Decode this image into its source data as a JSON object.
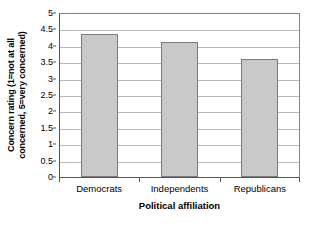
{
  "chart_data": {
    "type": "bar",
    "title": "",
    "categories": [
      "Democrats",
      "Independents",
      "Republicans"
    ],
    "values": [
      4.4,
      4.15,
      3.62
    ],
    "series": [
      {
        "name": "Concern rating",
        "values": [
          4.4,
          4.15,
          3.62
        ]
      }
    ],
    "xlabel": "Political affiliation",
    "ylabel": "Concern rating (1=not at all concerned, 5=very concerned)",
    "ylabel_line1": "Concern rating (1=not at all",
    "ylabel_line2": "concerned, 5=very concerned)",
    "ylim": [
      0,
      5
    ],
    "ytick_step": 0.5,
    "yticks": [
      "0",
      "0.5",
      "1",
      "1.5",
      "2",
      "2.5",
      "3",
      "3.5",
      "4",
      "4.5",
      "5"
    ],
    "ytick_values": [
      0,
      0.5,
      1,
      1.5,
      2,
      2.5,
      3,
      3.5,
      4,
      4.5,
      5
    ],
    "grid": true,
    "grid_axis": "y",
    "legend": "none",
    "colors": {
      "bar_fill": "#c9c9c9",
      "bar_border": "#7a7a7a",
      "gridline": "#b9b9b9",
      "axis": "#555555",
      "plot_border": "#808080",
      "background": "#ffffff",
      "text": "#000000"
    }
  }
}
